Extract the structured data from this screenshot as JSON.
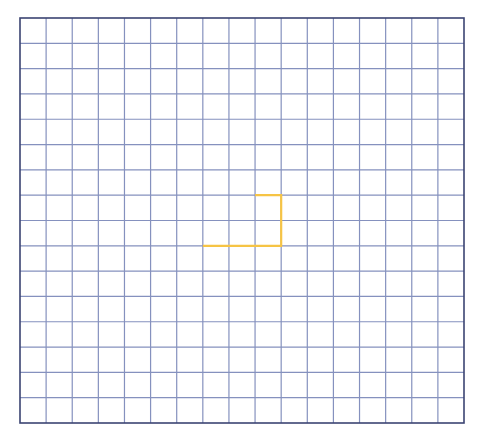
{
  "grid": {
    "columns": 17,
    "rows": 16,
    "origin_x": 20,
    "origin_y": 18,
    "width": 444,
    "height": 405,
    "line_color": "#8591BE",
    "border_color": "#3B4472",
    "background": "#ffffff"
  },
  "path": {
    "color": "#F6C445",
    "points": [
      [
        9,
        7
      ],
      [
        10,
        7
      ],
      [
        10,
        9
      ],
      [
        7,
        9
      ]
    ]
  }
}
